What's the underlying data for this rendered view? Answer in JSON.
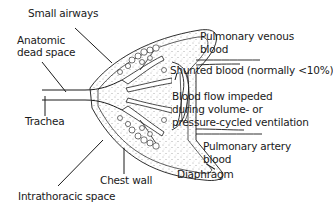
{
  "diagram": {
    "title": "",
    "labels": {
      "small_airways": "Small airways",
      "anatomic_dead_space_1": "Anatomic",
      "anatomic_dead_space_2": "dead space",
      "trachea": "Trachea",
      "pulmonary_venous_1": "Pulmonary venous",
      "pulmonary_venous_2": "blood",
      "shunted_blood": "Shunted blood (normally <10%)",
      "blood_flow_1": "Blood flow impeded",
      "blood_flow_2": "during volume- or",
      "blood_flow_3": "pressure-cycled ventilation",
      "pulmonary_artery_1": "Pulmonary artery",
      "pulmonary_artery_2": "blood",
      "diaphragm": "Diaphragm",
      "chest_wall": "Chest wall",
      "intrathoracic_space": "Intrathoracic space"
    },
    "colors": {
      "line": "#1a1a1a",
      "background": "#ffffff",
      "stipple": "#555555"
    }
  }
}
